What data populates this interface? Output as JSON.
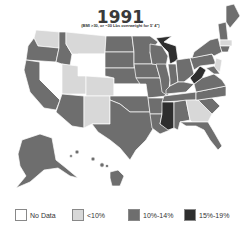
{
  "title": "1991",
  "subtitle": "(BMI >30, or ~30 Lbs overweight for 5' 4\")",
  "colors": {
    "no_data": "#ffffff",
    "lt10": "#d8d8d8",
    "p10_14": "#6e6e6e",
    "p15_19": "#2e2e2e",
    "border": "#ffffff"
  },
  "legend": [
    {
      "key": "no_data",
      "label": "No Data"
    },
    {
      "key": "lt10",
      "label": "<10%"
    },
    {
      "key": "p10_14",
      "label": "10%-14%"
    },
    {
      "key": "p15_19",
      "label": "15%-19%"
    }
  ],
  "states": {
    "no_data": [
      "Nevada",
      "Wyoming",
      "Kansas"
    ],
    "lt10": [
      "Washington",
      "Montana",
      "Idaho (partial)",
      "Utah",
      "Colorado",
      "New Mexico",
      "Georgia",
      "Massachusetts",
      "Connecticut"
    ],
    "p10_14": [
      "Oregon",
      "California",
      "Arizona",
      "North Dakota",
      "South Dakota",
      "Nebraska",
      "Oklahoma",
      "Texas",
      "Minnesota",
      "Iowa",
      "Missouri",
      "Arkansas",
      "Louisiana",
      "Wisconsin",
      "Illinois",
      "Indiana",
      "Ohio",
      "Kentucky",
      "Tennessee",
      "Alabama",
      "Florida",
      "South Carolina",
      "North Carolina",
      "Virginia",
      "Pennsylvania",
      "New York",
      "Maine",
      "Vermont",
      "New Hampshire",
      "Alaska",
      "Hawaii"
    ],
    "p15_19": [
      "Michigan",
      "West Virginia",
      "Mississippi"
    ]
  }
}
